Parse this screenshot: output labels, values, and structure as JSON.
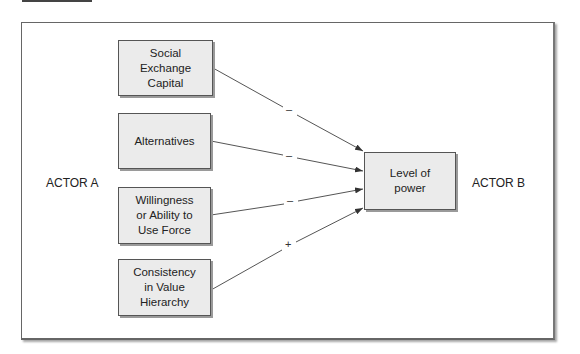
{
  "diagram": {
    "actor_a": "ACTOR A",
    "actor_b": "ACTOR B",
    "factors": [
      {
        "label": "Social\nExchange\nCapital",
        "sign": "–"
      },
      {
        "label": "Alternatives",
        "sign": "–"
      },
      {
        "label": "Willingness\nor Ability to\nUse Force",
        "sign": "–"
      },
      {
        "label": "Consistency\nin Value\nHierarchy",
        "sign": "+"
      }
    ],
    "outcome": "Level of\npower",
    "colors": {
      "box_fill": "#ebebeb",
      "line": "#444444"
    }
  }
}
